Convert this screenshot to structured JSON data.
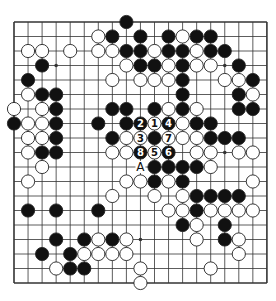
{
  "board": {
    "size": 19,
    "origin_x": 14,
    "origin_y": 22,
    "step_x": 14.05,
    "step_y": 14.5,
    "stone_radius": 6.6,
    "colors": {
      "line": "#333333",
      "black": "#111111",
      "white": "#ffffff",
      "stone_outline": "#222222"
    },
    "hoshi": [
      [
        3,
        3
      ],
      [
        3,
        15
      ],
      [
        9,
        15
      ],
      [
        15,
        9
      ]
    ],
    "marker": {
      "row": 10,
      "col": 9,
      "text": "A"
    },
    "stones": [
      {
        "r": 0,
        "c": 8,
        "s": "B"
      },
      {
        "r": 1,
        "c": 6,
        "s": "W"
      },
      {
        "r": 1,
        "c": 7,
        "s": "B"
      },
      {
        "r": 1,
        "c": 9,
        "s": "B"
      },
      {
        "r": 1,
        "c": 11,
        "s": "B"
      },
      {
        "r": 1,
        "c": 12,
        "s": "W"
      },
      {
        "r": 1,
        "c": 13,
        "s": "B"
      },
      {
        "r": 1,
        "c": 14,
        "s": "B"
      },
      {
        "r": 2,
        "c": 1,
        "s": "W"
      },
      {
        "r": 2,
        "c": 2,
        "s": "W"
      },
      {
        "r": 2,
        "c": 4,
        "s": "W"
      },
      {
        "r": 2,
        "c": 6,
        "s": "W"
      },
      {
        "r": 2,
        "c": 7,
        "s": "W"
      },
      {
        "r": 2,
        "c": 8,
        "s": "B"
      },
      {
        "r": 2,
        "c": 9,
        "s": "B"
      },
      {
        "r": 2,
        "c": 10,
        "s": "W"
      },
      {
        "r": 2,
        "c": 11,
        "s": "B"
      },
      {
        "r": 2,
        "c": 12,
        "s": "B"
      },
      {
        "r": 2,
        "c": 13,
        "s": "W"
      },
      {
        "r": 2,
        "c": 14,
        "s": "B"
      },
      {
        "r": 2,
        "c": 15,
        "s": "B"
      },
      {
        "r": 3,
        "c": 2,
        "s": "B"
      },
      {
        "r": 3,
        "c": 8,
        "s": "W"
      },
      {
        "r": 3,
        "c": 9,
        "s": "B"
      },
      {
        "r": 3,
        "c": 10,
        "s": "B"
      },
      {
        "r": 3,
        "c": 11,
        "s": "W"
      },
      {
        "r": 3,
        "c": 12,
        "s": "B"
      },
      {
        "r": 3,
        "c": 13,
        "s": "W"
      },
      {
        "r": 3,
        "c": 14,
        "s": "W"
      },
      {
        "r": 3,
        "c": 16,
        "s": "B"
      },
      {
        "r": 4,
        "c": 1,
        "s": "B"
      },
      {
        "r": 4,
        "c": 7,
        "s": "W"
      },
      {
        "r": 4,
        "c": 9,
        "s": "W"
      },
      {
        "r": 4,
        "c": 10,
        "s": "W"
      },
      {
        "r": 4,
        "c": 11,
        "s": "W"
      },
      {
        "r": 4,
        "c": 12,
        "s": "B"
      },
      {
        "r": 4,
        "c": 15,
        "s": "W"
      },
      {
        "r": 4,
        "c": 16,
        "s": "W"
      },
      {
        "r": 4,
        "c": 17,
        "s": "B"
      },
      {
        "r": 5,
        "c": 1,
        "s": "W"
      },
      {
        "r": 5,
        "c": 2,
        "s": "B"
      },
      {
        "r": 5,
        "c": 3,
        "s": "B"
      },
      {
        "r": 5,
        "c": 12,
        "s": "B"
      },
      {
        "r": 5,
        "c": 16,
        "s": "B"
      },
      {
        "r": 5,
        "c": 17,
        "s": "W"
      },
      {
        "r": 6,
        "c": 0,
        "s": "W"
      },
      {
        "r": 6,
        "c": 2,
        "s": "W"
      },
      {
        "r": 6,
        "c": 3,
        "s": "B"
      },
      {
        "r": 6,
        "c": 7,
        "s": "B"
      },
      {
        "r": 6,
        "c": 8,
        "s": "B"
      },
      {
        "r": 6,
        "c": 10,
        "s": "B"
      },
      {
        "r": 6,
        "c": 11,
        "s": "W"
      },
      {
        "r": 6,
        "c": 12,
        "s": "B"
      },
      {
        "r": 6,
        "c": 13,
        "s": "W"
      },
      {
        "r": 6,
        "c": 16,
        "s": "B"
      },
      {
        "r": 6,
        "c": 17,
        "s": "B"
      },
      {
        "r": 7,
        "c": 0,
        "s": "B"
      },
      {
        "r": 7,
        "c": 1,
        "s": "W"
      },
      {
        "r": 7,
        "c": 2,
        "s": "W"
      },
      {
        "r": 7,
        "c": 3,
        "s": "B"
      },
      {
        "r": 7,
        "c": 6,
        "s": "B"
      },
      {
        "r": 7,
        "c": 8,
        "s": "B"
      },
      {
        "r": 7,
        "c": 9,
        "s": "B",
        "n": "2"
      },
      {
        "r": 7,
        "c": 10,
        "s": "W",
        "n": "1"
      },
      {
        "r": 7,
        "c": 11,
        "s": "B",
        "n": "4"
      },
      {
        "r": 7,
        "c": 12,
        "s": "W"
      },
      {
        "r": 7,
        "c": 13,
        "s": "B"
      },
      {
        "r": 7,
        "c": 14,
        "s": "B"
      },
      {
        "r": 8,
        "c": 1,
        "s": "W"
      },
      {
        "r": 8,
        "c": 2,
        "s": "W"
      },
      {
        "r": 8,
        "c": 3,
        "s": "B"
      },
      {
        "r": 8,
        "c": 7,
        "s": "B"
      },
      {
        "r": 8,
        "c": 8,
        "s": "W"
      },
      {
        "r": 8,
        "c": 9,
        "s": "W",
        "n": "3"
      },
      {
        "r": 8,
        "c": 10,
        "s": "B"
      },
      {
        "r": 8,
        "c": 11,
        "s": "W",
        "n": "7"
      },
      {
        "r": 8,
        "c": 12,
        "s": "W"
      },
      {
        "r": 8,
        "c": 13,
        "s": "W"
      },
      {
        "r": 8,
        "c": 14,
        "s": "B"
      },
      {
        "r": 8,
        "c": 15,
        "s": "B"
      },
      {
        "r": 8,
        "c": 16,
        "s": "B"
      },
      {
        "r": 9,
        "c": 1,
        "s": "W"
      },
      {
        "r": 9,
        "c": 2,
        "s": "B"
      },
      {
        "r": 9,
        "c": 3,
        "s": "B"
      },
      {
        "r": 9,
        "c": 7,
        "s": "W"
      },
      {
        "r": 9,
        "c": 8,
        "s": "W"
      },
      {
        "r": 9,
        "c": 9,
        "s": "B",
        "n": "8"
      },
      {
        "r": 9,
        "c": 10,
        "s": "W",
        "n": "5"
      },
      {
        "r": 9,
        "c": 11,
        "s": "B",
        "n": "6"
      },
      {
        "r": 9,
        "c": 13,
        "s": "W"
      },
      {
        "r": 9,
        "c": 14,
        "s": "W"
      },
      {
        "r": 9,
        "c": 16,
        "s": "W"
      },
      {
        "r": 9,
        "c": 17,
        "s": "W"
      },
      {
        "r": 10,
        "c": 2,
        "s": "W"
      },
      {
        "r": 10,
        "c": 10,
        "s": "B"
      },
      {
        "r": 10,
        "c": 11,
        "s": "B"
      },
      {
        "r": 10,
        "c": 12,
        "s": "B"
      },
      {
        "r": 10,
        "c": 13,
        "s": "B"
      },
      {
        "r": 10,
        "c": 14,
        "s": "W"
      },
      {
        "r": 11,
        "c": 1,
        "s": "W"
      },
      {
        "r": 11,
        "c": 8,
        "s": "W"
      },
      {
        "r": 11,
        "c": 9,
        "s": "W"
      },
      {
        "r": 11,
        "c": 10,
        "s": "B"
      },
      {
        "r": 11,
        "c": 11,
        "s": "W"
      },
      {
        "r": 11,
        "c": 12,
        "s": "B"
      },
      {
        "r": 11,
        "c": 17,
        "s": "W"
      },
      {
        "r": 12,
        "c": 7,
        "s": "W"
      },
      {
        "r": 12,
        "c": 10,
        "s": "W"
      },
      {
        "r": 12,
        "c": 12,
        "s": "W"
      },
      {
        "r": 12,
        "c": 13,
        "s": "B"
      },
      {
        "r": 12,
        "c": 14,
        "s": "B"
      },
      {
        "r": 12,
        "c": 15,
        "s": "B"
      },
      {
        "r": 12,
        "c": 16,
        "s": "B"
      },
      {
        "r": 13,
        "c": 1,
        "s": "B"
      },
      {
        "r": 13,
        "c": 3,
        "s": "B"
      },
      {
        "r": 13,
        "c": 6,
        "s": "B"
      },
      {
        "r": 13,
        "c": 11,
        "s": "W"
      },
      {
        "r": 13,
        "c": 12,
        "s": "W"
      },
      {
        "r": 13,
        "c": 13,
        "s": "B"
      },
      {
        "r": 13,
        "c": 14,
        "s": "W"
      },
      {
        "r": 13,
        "c": 15,
        "s": "W"
      },
      {
        "r": 13,
        "c": 16,
        "s": "W"
      },
      {
        "r": 13,
        "c": 17,
        "s": "W"
      },
      {
        "r": 14,
        "c": 12,
        "s": "B"
      },
      {
        "r": 14,
        "c": 13,
        "s": "W"
      },
      {
        "r": 14,
        "c": 15,
        "s": "B"
      },
      {
        "r": 15,
        "c": 3,
        "s": "B"
      },
      {
        "r": 15,
        "c": 5,
        "s": "B"
      },
      {
        "r": 15,
        "c": 6,
        "s": "W"
      },
      {
        "r": 15,
        "c": 7,
        "s": "B"
      },
      {
        "r": 15,
        "c": 8,
        "s": "W"
      },
      {
        "r": 15,
        "c": 13,
        "s": "W"
      },
      {
        "r": 15,
        "c": 15,
        "s": "B"
      },
      {
        "r": 15,
        "c": 16,
        "s": "W"
      },
      {
        "r": 16,
        "c": 2,
        "s": "B"
      },
      {
        "r": 16,
        "c": 4,
        "s": "B"
      },
      {
        "r": 16,
        "c": 5,
        "s": "W"
      },
      {
        "r": 16,
        "c": 6,
        "s": "W"
      },
      {
        "r": 16,
        "c": 7,
        "s": "W"
      },
      {
        "r": 16,
        "c": 8,
        "s": "W"
      },
      {
        "r": 16,
        "c": 16,
        "s": "W"
      },
      {
        "r": 17,
        "c": 3,
        "s": "W"
      },
      {
        "r": 17,
        "c": 4,
        "s": "B"
      },
      {
        "r": 17,
        "c": 5,
        "s": "B"
      },
      {
        "r": 17,
        "c": 9,
        "s": "W"
      },
      {
        "r": 17,
        "c": 14,
        "s": "W"
      },
      {
        "r": 18,
        "c": 9,
        "s": "W"
      }
    ]
  }
}
